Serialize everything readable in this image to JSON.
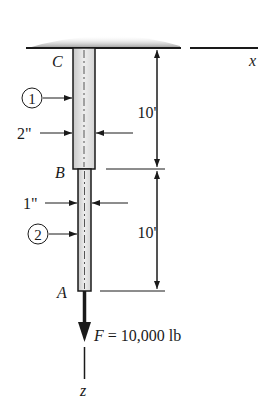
{
  "diagram": {
    "support": {
      "label": "ceiling-support"
    },
    "points": {
      "top": "C",
      "middle": "B",
      "bottom": "A"
    },
    "segments": [
      {
        "id": "1",
        "diameter": "2\"",
        "length": "10'"
      },
      {
        "id": "2",
        "diameter": "1\"",
        "length": "10'"
      }
    ],
    "axes": {
      "x": "x",
      "z": "z"
    },
    "load": {
      "label": "F = 10,000 lb",
      "symbol": "F",
      "value": "= 10,000 lb"
    },
    "colors": {
      "line": "#1a1a1a",
      "rod_fill": "#d9d9d9",
      "rod_highlight": "#f2f2f2",
      "support_shade": "#8c8c8c"
    }
  }
}
